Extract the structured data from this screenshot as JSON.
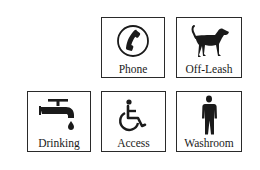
{
  "signs": [
    {
      "id": "phone",
      "label": "Phone",
      "icon": "phone-icon"
    },
    {
      "id": "off-leash",
      "label": "Off-Leash",
      "icon": "dog-icon"
    },
    {
      "id": "drinking",
      "label": "Drinking",
      "icon": "water-faucet-icon"
    },
    {
      "id": "access",
      "label": "Access",
      "icon": "wheelchair-icon"
    },
    {
      "id": "washroom",
      "label": "Washroom",
      "icon": "person-icon"
    }
  ],
  "colors": {
    "ink": "#1a1a1a",
    "border": "#2a2a2a",
    "background": "#ffffff"
  }
}
